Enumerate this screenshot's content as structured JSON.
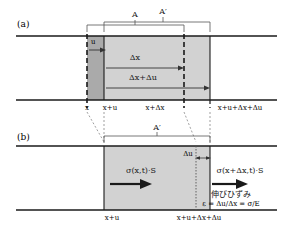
{
  "figure": {
    "colors": {
      "line": "#1a1a1a",
      "fill_light": "#d2d2d2",
      "fill_dark": "#aaaaaa",
      "text": "#1a1a1a",
      "background": "#ffffff"
    },
    "panels": [
      {
        "id": "a",
        "label": "(a)",
        "bracket_labels": [
          {
            "name": "A",
            "text": "A"
          },
          {
            "name": "A-prime",
            "text": "A′"
          }
        ],
        "inner_labels": [
          {
            "name": "u",
            "text": "u"
          },
          {
            "name": "delta-x",
            "text": "Δx"
          },
          {
            "name": "delta-x-plus-delta-u",
            "text": "Δx+Δu"
          }
        ],
        "axis_labels": [
          {
            "name": "x",
            "text": "x"
          },
          {
            "name": "x-plus-u",
            "text": "x+u"
          },
          {
            "name": "x-plus-delta-x",
            "text": "x+Δx"
          },
          {
            "name": "x-plus-u-plus-delta-x-plus-delta-u",
            "text": "x+u+Δx+Δu"
          }
        ]
      },
      {
        "id": "b",
        "label": "(b)",
        "bracket_labels": [
          {
            "name": "A-prime",
            "text": "A′"
          }
        ],
        "inner_labels": [
          {
            "name": "delta-u",
            "text": "Δu"
          },
          {
            "name": "sigma-left",
            "text": "σ(x,t)·S"
          },
          {
            "name": "sigma-right",
            "text": "σ(x+Δx,t)·S"
          },
          {
            "name": "strain-caption-jp",
            "text": "伸びひずみ"
          },
          {
            "name": "strain-formula",
            "text": "ε = Δu/Δx = σ/E"
          }
        ],
        "axis_labels": [
          {
            "name": "x-plus-u",
            "text": "x+u"
          },
          {
            "name": "x-plus-u-plus-delta-x-plus-delta-u",
            "text": "x+u+Δx+Δu"
          }
        ]
      }
    ]
  }
}
